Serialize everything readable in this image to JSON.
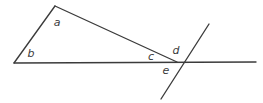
{
  "diagram": {
    "background_color": "#ffffff",
    "stroke_color": "#3b3b3b",
    "label_color": "#3b3b3b",
    "canvas": {
      "width": 263,
      "height": 103
    },
    "points": {
      "left_vertex": {
        "x": 14,
        "y": 63
      },
      "apex": {
        "x": 55,
        "y": 6
      },
      "intersection": {
        "x": 177,
        "y": 62
      },
      "horizontal_left_end": {
        "x": 14,
        "y": 63
      },
      "horizontal_right_end": {
        "x": 256,
        "y": 62
      },
      "transversal_top_end": {
        "x": 209,
        "y": 24
      },
      "transversal_bottom_end": {
        "x": 161,
        "y": 99
      }
    },
    "segments": [
      {
        "name": "left-side",
        "from": "left_vertex",
        "to": "apex"
      },
      {
        "name": "hypotenuse",
        "from": "apex",
        "to": "intersection"
      },
      {
        "name": "horizontal-line",
        "from": "horizontal_left_end",
        "to": "horizontal_right_end"
      },
      {
        "name": "transversal-line",
        "from": "transversal_top_end",
        "to": "transversal_bottom_end"
      }
    ],
    "labels": [
      {
        "id": "a",
        "text": "a",
        "x": 57,
        "y": 23,
        "description": "angle at apex of triangle"
      },
      {
        "id": "b",
        "text": "b",
        "x": 31,
        "y": 54,
        "description": "angle at left vertex of triangle"
      },
      {
        "id": "c",
        "text": "c",
        "x": 151,
        "y": 57,
        "description": "angle above horizontal line left of intersection"
      },
      {
        "id": "d",
        "text": "d",
        "x": 176,
        "y": 51,
        "description": "angle between hypotenuse and transversal above line"
      },
      {
        "id": "e",
        "text": "e",
        "x": 166,
        "y": 71,
        "description": "angle below horizontal line left of transversal"
      }
    ]
  }
}
